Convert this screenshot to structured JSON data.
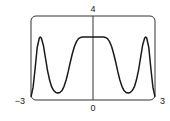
{
  "chart_data": {
    "type": "line",
    "title": "",
    "xlabel": "",
    "ylabel": "",
    "xlim": [
      -3,
      3
    ],
    "ylim": [
      0,
      4
    ],
    "grid": false,
    "legend": null,
    "x_ticks": [
      -3,
      0,
      3
    ],
    "y_ticks": [
      4
    ],
    "tick_labels": {
      "x_left": "−3",
      "x_center": "0",
      "x_right": "3",
      "y_top": "4"
    },
    "note": "Values are estimated from pixel positions; only the peaks, minima, plateau and edges were read directly. Intermediate points are interpolated along the visible curve shape, so y-values are approximate (about +/-0.1).",
    "series": [
      {
        "name": "f(x)",
        "x": [
          -3.0,
          -2.9,
          -2.8,
          -2.7,
          -2.6,
          -2.55,
          -2.5,
          -2.4,
          -2.3,
          -2.2,
          -2.1,
          -2.0,
          -1.9,
          -1.8,
          -1.7,
          -1.6,
          -1.5,
          -1.4,
          -1.3,
          -1.2,
          -1.1,
          -1.0,
          -0.9,
          -0.8,
          -0.7,
          -0.6,
          -0.5,
          -0.4,
          -0.3,
          -0.2,
          -0.1,
          0.0,
          0.1,
          0.2,
          0.3,
          0.4,
          0.5,
          0.6,
          0.7,
          0.8,
          0.9,
          1.0,
          1.1,
          1.2,
          1.3,
          1.4,
          1.5,
          1.6,
          1.7,
          1.8,
          1.9,
          2.0,
          2.1,
          2.2,
          2.3,
          2.4,
          2.5,
          2.55,
          2.6,
          2.7,
          2.8,
          2.9,
          3.0
        ],
        "values": [
          0.15,
          0.6,
          1.5,
          2.5,
          2.95,
          3.0,
          2.95,
          2.6,
          2.0,
          1.4,
          0.95,
          0.62,
          0.45,
          0.36,
          0.33,
          0.36,
          0.45,
          0.65,
          0.95,
          1.35,
          1.8,
          2.2,
          2.55,
          2.78,
          2.92,
          2.98,
          3.0,
          3.0,
          3.0,
          3.0,
          3.0,
          3.0,
          3.0,
          3.0,
          3.0,
          3.0,
          3.0,
          2.98,
          2.92,
          2.78,
          2.55,
          2.2,
          1.8,
          1.35,
          0.95,
          0.65,
          0.45,
          0.36,
          0.33,
          0.36,
          0.45,
          0.62,
          0.95,
          1.4,
          2.0,
          2.6,
          2.95,
          3.0,
          2.95,
          2.5,
          1.5,
          0.6,
          0.15
        ]
      }
    ]
  },
  "colors": {
    "line": "#1a1a1a",
    "frame": "#333333",
    "axis": "#333333",
    "background": "#ffffff"
  }
}
